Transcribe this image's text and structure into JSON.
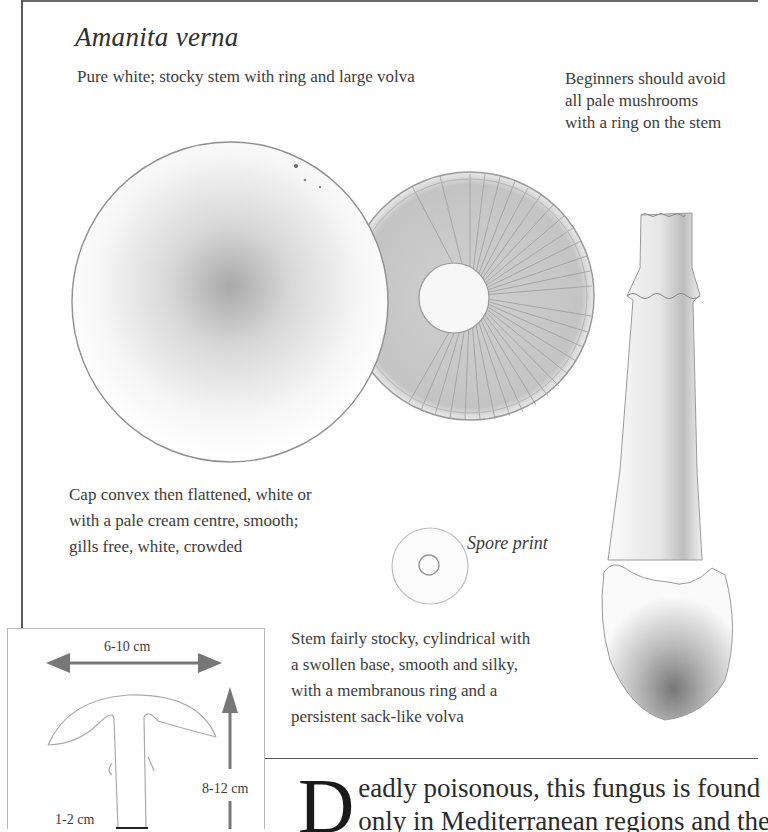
{
  "species": {
    "title": "Amanita verna",
    "summary": "Pure white; stocky stem with ring and large volva",
    "warning": "Beginners should avoid\nall pale mushrooms\nwith a ring on the stem"
  },
  "captions": {
    "cap": "Cap convex then flattened, white or\nwith a pale cream centre, smooth;\ngills free, white, crowded",
    "spore_print": "Spore print",
    "stem": "Stem fairly stocky, cylindrical with\na swollen base, smooth and silky,\nwith a membranous ring and a\npersistent sack-like volva"
  },
  "size_chart": {
    "cap_width": "6-10 cm",
    "height": "8-12 cm",
    "stem_width": "1-2 cm",
    "arrow_color": "#777777"
  },
  "body": {
    "drop_cap": "D",
    "line1": "eadly poisonous, this fungus is found",
    "line2": "only in Mediterranean regions and the south"
  },
  "illustrations": {
    "cap_top": "cap-top-view",
    "cap_underside": "gills-underside-view",
    "spore_print": "spore-print",
    "stem": "stem-with-ring-and-volva"
  }
}
